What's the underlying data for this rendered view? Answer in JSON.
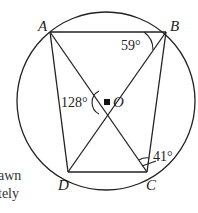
{
  "diagram": {
    "type": "circle-geometry",
    "center_label": "O",
    "points": [
      {
        "label": "A",
        "x": 50,
        "y": 32
      },
      {
        "label": "B",
        "x": 166,
        "y": 32
      },
      {
        "label": "C",
        "x": 147,
        "y": 172
      },
      {
        "label": "D",
        "x": 68,
        "y": 172
      }
    ],
    "center": {
      "label": "O",
      "x": 107,
      "y": 102
    },
    "circle": {
      "cx": 106,
      "cy": 101,
      "r": 89
    },
    "segments": [
      "AB",
      "AD",
      "BC",
      "DC",
      "AC",
      "BD"
    ],
    "angles": [
      {
        "label": "59°",
        "at": "B",
        "between": "AB,BD"
      },
      {
        "label": "128°",
        "at": "O",
        "between": "AOD"
      },
      {
        "label": "41°",
        "at": "C",
        "between": "BC,AC"
      }
    ]
  },
  "labels": {
    "A": "A",
    "B": "B",
    "C": "C",
    "D": "D",
    "O": "O",
    "angle_B": "59°",
    "angle_O": "128°",
    "angle_C": "41°"
  },
  "side_text": {
    "line1": "awn",
    "line2": "tely"
  },
  "colors": {
    "stroke": "#222222",
    "background": "#ffffff"
  }
}
